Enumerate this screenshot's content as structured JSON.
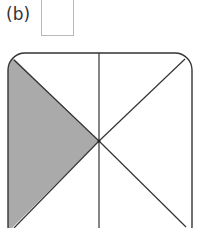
{
  "question": {
    "label": "(b)",
    "answer_box": ""
  },
  "figure": {
    "colors": {
      "outline": "#333333",
      "shaded": "#aaaaaa",
      "background": "#ffffff",
      "box_border": "#b8b8b8"
    },
    "shaded_region": "left"
  }
}
